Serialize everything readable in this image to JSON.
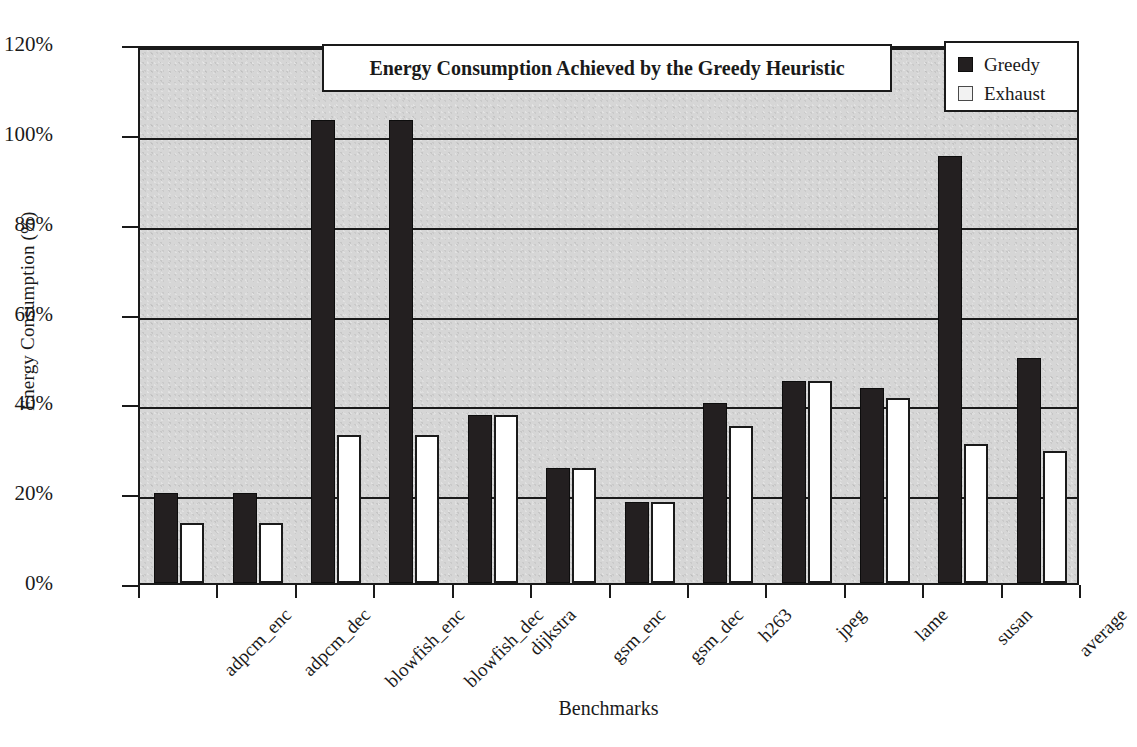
{
  "chart_data": {
    "type": "bar",
    "title": "Energy Consumption Achieved by the Greedy Heuristic",
    "xlabel": "Benchmarks",
    "ylabel": "Energy Consumption (%)",
    "ylim": [
      0,
      120
    ],
    "ytick_labels": [
      "120%",
      "100%",
      "80%",
      "60%",
      "40%",
      "20%",
      "0%"
    ],
    "ytick_values": [
      120,
      100,
      80,
      60,
      40,
      20,
      0
    ],
    "grid": true,
    "legend_position": "top-right",
    "categories": [
      "adpcm_enc",
      "adpcm_dec",
      "blowfish_enc",
      "blowfish_dec",
      "dijkstra",
      "gsm_enc",
      "gsm_dec",
      "h263",
      "jpeg",
      "lame",
      "susan",
      "average"
    ],
    "series": [
      {
        "name": "Greedy",
        "color": "#231f20",
        "values": [
          20.0,
          20.0,
          103.0,
          103.0,
          37.5,
          25.5,
          18.0,
          40.0,
          45.0,
          43.5,
          95.0,
          50.0
        ]
      },
      {
        "name": "Exhaust",
        "color": "#ffffff",
        "values": [
          13.3,
          13.3,
          33.0,
          33.0,
          37.5,
          25.5,
          18.0,
          35.0,
          45.0,
          41.3,
          31.0,
          29.5
        ]
      }
    ]
  },
  "legend": {
    "entries": [
      {
        "label": "Greedy"
      },
      {
        "label": "Exhaust"
      }
    ]
  }
}
